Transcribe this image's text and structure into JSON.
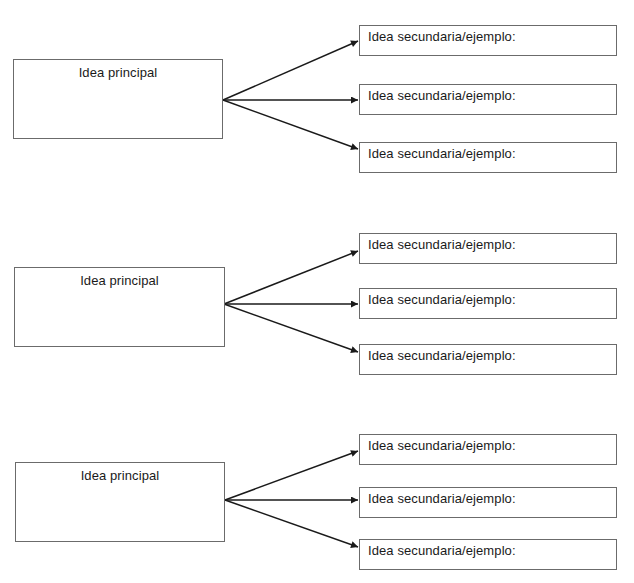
{
  "diagram": {
    "type": "concept-map-worksheet",
    "line_color": "#1a1a1a",
    "border_color": "#6b6b6b",
    "groups": [
      {
        "main": {
          "label": "Idea principal",
          "x": 13,
          "y": 59,
          "w": 210,
          "h": 80
        },
        "origin": [
          223,
          100
        ],
        "branches": [
          {
            "label": "Idea secundaria/ejemplo:",
            "x": 359,
            "y": 25,
            "w": 258,
            "h": 31,
            "tip": [
              358,
              41
            ]
          },
          {
            "label": "Idea secundaria/ejemplo:",
            "x": 359,
            "y": 84,
            "w": 258,
            "h": 31,
            "tip": [
              358,
              100
            ]
          },
          {
            "label": "Idea secundaria/ejemplo:",
            "x": 359,
            "y": 142,
            "w": 258,
            "h": 31,
            "tip": [
              358,
              149
            ]
          }
        ]
      },
      {
        "main": {
          "label": "Idea principal",
          "x": 14,
          "y": 267,
          "w": 211,
          "h": 80
        },
        "origin": [
          224,
          304
        ],
        "branches": [
          {
            "label": "Idea secundaria/ejemplo:",
            "x": 359,
            "y": 233,
            "w": 258,
            "h": 31,
            "tip": [
              358,
              251
            ]
          },
          {
            "label": "Idea secundaria/ejemplo:",
            "x": 359,
            "y": 288,
            "w": 258,
            "h": 31,
            "tip": [
              358,
              304
            ]
          },
          {
            "label": "Idea secundaria/ejemplo:",
            "x": 359,
            "y": 344,
            "w": 258,
            "h": 31,
            "tip": [
              358,
              352
            ]
          }
        ]
      },
      {
        "main": {
          "label": "Idea principal",
          "x": 15,
          "y": 462,
          "w": 210,
          "h": 80
        },
        "origin": [
          225,
          500
        ],
        "branches": [
          {
            "label": "Idea secundaria/ejemplo:",
            "x": 359,
            "y": 434,
            "w": 258,
            "h": 31,
            "tip": [
              358,
              451
            ]
          },
          {
            "label": "Idea secundaria/ejemplo:",
            "x": 359,
            "y": 487,
            "w": 258,
            "h": 31,
            "tip": [
              358,
              500
            ]
          },
          {
            "label": "Idea secundaria/ejemplo:",
            "x": 359,
            "y": 539,
            "w": 258,
            "h": 31,
            "tip": [
              358,
              547
            ]
          }
        ]
      }
    ]
  }
}
